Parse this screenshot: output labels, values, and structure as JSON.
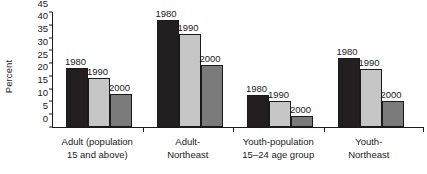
{
  "chart_data": {
    "type": "bar",
    "title": "",
    "xlabel": "",
    "ylabel": "Percent",
    "ylim": [
      0,
      45
    ],
    "yticks": [
      0,
      5,
      10,
      15,
      20,
      25,
      30,
      35,
      40,
      45
    ],
    "grid": false,
    "legend": "none",
    "value_labels_shown": true,
    "categories": [
      "Adult (population 15 and above)",
      "Adult-Northeast",
      "Youth-population 15–24 age group",
      "Youth-Northeast"
    ],
    "category_lines": [
      [
        "Adult (population",
        "15 and above)"
      ],
      [
        "Adult-",
        "Northeast"
      ],
      [
        "Youth-population",
        "15–24 age group"
      ],
      [
        "Youth-",
        "Northeast"
      ]
    ],
    "series": [
      {
        "name": "1980",
        "color": "#231f20",
        "values": [
          23,
          42,
          12.5,
          27
        ]
      },
      {
        "name": "1990",
        "color": "#c6c6c6",
        "values": [
          19,
          36.5,
          10,
          22.8
        ]
      },
      {
        "name": "2000",
        "color": "#7b7b7b",
        "values": [
          12.8,
          24.4,
          4.4,
          10
        ]
      }
    ]
  },
  "axis": {
    "y_title": "Percent"
  }
}
